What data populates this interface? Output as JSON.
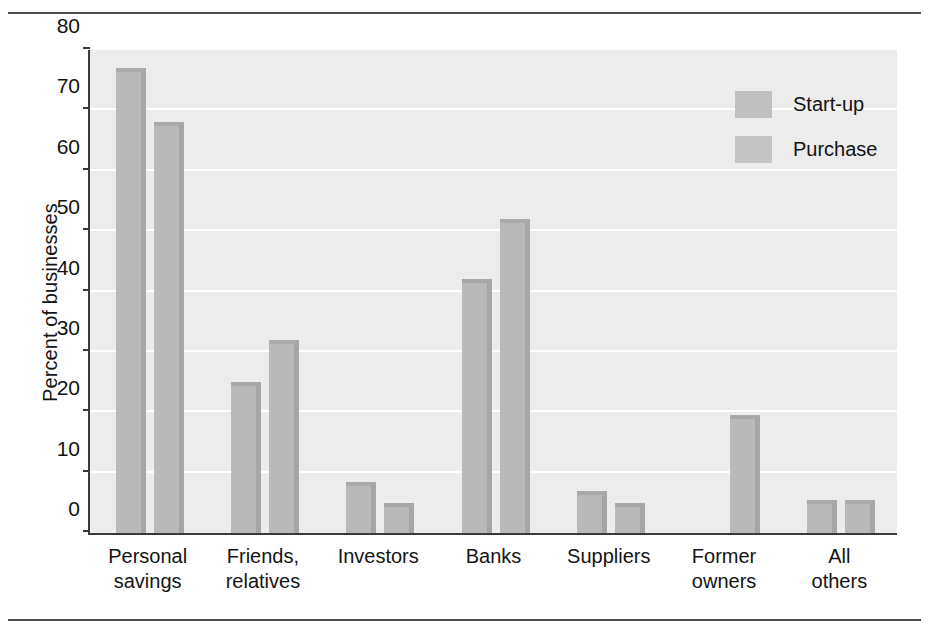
{
  "figure": {
    "ylabel": "Percent of businesses",
    "top_rule": "horizontal-rule",
    "bottom_rule": "horizontal-rule"
  },
  "legend": {
    "position": "top-right",
    "entries": [
      {
        "label": "Start-up",
        "swatch": "gray-swatch"
      },
      {
        "label": "Purchase",
        "swatch": "gray-swatch"
      }
    ]
  },
  "chart_data": {
    "type": "bar",
    "title": "",
    "xlabel": "",
    "ylabel": "Percent of businesses",
    "ylim": [
      0,
      80
    ],
    "yticks": [
      0,
      10,
      20,
      30,
      40,
      50,
      60,
      70,
      80
    ],
    "grid": true,
    "legend_position": "top-right",
    "categories": [
      "Personal savings",
      "Friends, relatives",
      "Investors",
      "Banks",
      "Suppliers",
      "Former owners",
      "All others"
    ],
    "series": [
      {
        "name": "Start-up",
        "values": [
          77,
          25,
          8.5,
          42,
          7,
          0,
          5.5
        ]
      },
      {
        "name": "Purchase",
        "values": [
          68,
          32,
          5,
          52,
          5,
          19.5,
          5.5
        ]
      }
    ]
  },
  "colors": {
    "bar_face": "#b9b9b9",
    "bar_shade": "#a6a6a6",
    "plot_background": "#ececec",
    "gridline": "#ffffff",
    "axis": "#3a3a3a",
    "text": "#141414"
  }
}
